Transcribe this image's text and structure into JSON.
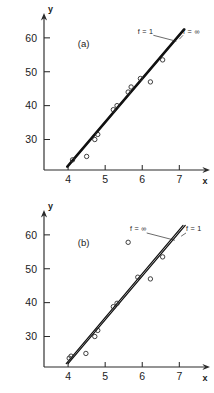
{
  "figure": {
    "background": "#ffffff",
    "ink": "#1b1b1b",
    "panels": [
      "a",
      "b"
    ]
  },
  "chart_data": [
    {
      "type": "scatter",
      "panel_label": "(a)",
      "title": "",
      "xlabel": "x",
      "ylabel": "y",
      "xlim": [
        3.35,
        7.45
      ],
      "ylim": [
        21.0,
        63.5
      ],
      "xticks": [
        4,
        5,
        6,
        7
      ],
      "xticklabels": [
        "4",
        "5",
        "6",
        "7"
      ],
      "yticks": [
        30,
        40,
        50,
        60
      ],
      "yticklabels": [
        "30",
        "40",
        "50",
        "60"
      ],
      "grid": false,
      "legend_position": "upper-right-inline",
      "points": [
        {
          "x": 4.12,
          "y": 24.0
        },
        {
          "x": 4.5,
          "y": 25.0
        },
        {
          "x": 4.72,
          "y": 30.0
        },
        {
          "x": 4.8,
          "y": 31.5
        },
        {
          "x": 5.22,
          "y": 38.8
        },
        {
          "x": 5.32,
          "y": 40.0
        },
        {
          "x": 5.62,
          "y": 44.0
        },
        {
          "x": 5.7,
          "y": 45.5
        },
        {
          "x": 5.95,
          "y": 48.0
        },
        {
          "x": 6.22,
          "y": 47.0
        },
        {
          "x": 6.55,
          "y": 53.5
        }
      ],
      "series": [
        {
          "name": "f = 1",
          "label": "f = 1",
          "style": "solid",
          "endpoints": [
            [
              3.97,
              22.0
            ],
            [
              7.12,
              62.5
            ]
          ]
        },
        {
          "name": "f = ∞",
          "label": "f = ∞",
          "style": "solid",
          "endpoints": [
            [
              3.99,
              22.0
            ],
            [
              7.14,
              62.5
            ]
          ]
        }
      ],
      "annotations": [
        {
          "text": "f = 1",
          "x": 6.3,
          "y": 61.2,
          "leader_to": [
            6.92,
            59.0
          ]
        },
        {
          "text": "f = ∞",
          "x": 7.1,
          "y": 61.2,
          "leader_to": [
            7.0,
            59.6
          ]
        },
        {
          "text": "(a)",
          "x": 4.42,
          "y": 57.3
        }
      ]
    },
    {
      "type": "scatter",
      "panel_label": "(b)",
      "title": "",
      "xlabel": "x",
      "ylabel": "y",
      "xlim": [
        3.35,
        7.45
      ],
      "ylim": [
        21.0,
        63.5
      ],
      "xticks": [
        4,
        5,
        6,
        7
      ],
      "xticklabels": [
        "4",
        "5",
        "6",
        "7"
      ],
      "yticks": [
        30,
        40,
        50,
        60
      ],
      "yticklabels": [
        "30",
        "40",
        "50",
        "60"
      ],
      "grid": false,
      "legend_position": "upper-right-inline",
      "points": [
        {
          "x": 4.03,
          "y": 23.6
        },
        {
          "x": 4.08,
          "y": 24.2
        },
        {
          "x": 4.48,
          "y": 25.0
        },
        {
          "x": 4.72,
          "y": 30.0
        },
        {
          "x": 4.8,
          "y": 31.8
        },
        {
          "x": 5.22,
          "y": 38.8
        },
        {
          "x": 5.32,
          "y": 39.8
        },
        {
          "x": 5.62,
          "y": 57.8
        },
        {
          "x": 5.88,
          "y": 47.5
        },
        {
          "x": 6.22,
          "y": 47.0
        },
        {
          "x": 6.55,
          "y": 53.5
        }
      ],
      "series": [
        {
          "name": "f = ∞",
          "label": "f = ∞",
          "style": "solid",
          "endpoints": [
            [
              3.95,
              22.0
            ],
            [
              7.1,
              62.8
            ]
          ]
        },
        {
          "name": "f = 1",
          "label": "f = 1",
          "style": "solid",
          "endpoints": [
            [
              4.0,
              22.0
            ],
            [
              7.16,
              62.8
            ]
          ]
        }
      ],
      "annotations": [
        {
          "text": "f = ∞",
          "x": 6.12,
          "y": 61.0,
          "leader_to": [
            6.88,
            58.4
          ]
        },
        {
          "text": "f = 1",
          "x": 7.18,
          "y": 61.0,
          "leader_to": [
            7.05,
            59.6
          ]
        },
        {
          "text": "(b)",
          "x": 4.42,
          "y": 56.6
        }
      ]
    }
  ]
}
